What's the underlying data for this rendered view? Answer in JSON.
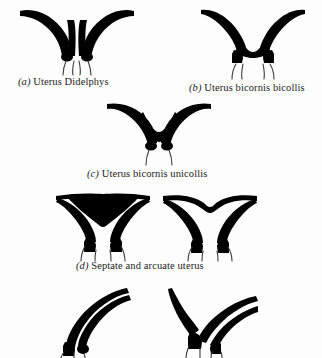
{
  "figure": {
    "background_color": "#fdfdfd",
    "ink_color": "#000000",
    "canal_line_color": "#3a3a3a",
    "panels": [
      {
        "id": "a",
        "label": "(a)",
        "name": "Uterus Didelphys",
        "caption": "(a) Uterus Didelphys",
        "description": "Two entirely separate uterine horns, each with its own cervical canal; three trailing canal lines",
        "horns": 2,
        "cervical_canals": 2
      },
      {
        "id": "b",
        "label": "(b)",
        "name": "Uterus bicornis bicollis",
        "caption": "(b) Uterus bicornis bicollis",
        "description": "Two horns fused at a deep V fundus with two separate cervices",
        "horns": 2,
        "cervical_canals": 2
      },
      {
        "id": "c",
        "label": "(c)",
        "name": "Uterus bicornis unicollis",
        "caption": "(c) Uterus bicornis unicollis",
        "description": "Two horns joining into a single cervix; deep V shaped fundal cleft",
        "horns": 2,
        "cervical_canals": 1
      },
      {
        "id": "d",
        "label": "(d)",
        "name": "Septate and arcuate uterus",
        "caption": "(d) Septate and arcuate uterus",
        "description": "Left drawing: septate uterus with broad flat fundus and thick midline septum. Right drawing: arcuate uterus with a shallow fundal indentation",
        "horns": 2,
        "cervical_canals": 1,
        "sub_figures": [
          {
            "id": "d-left",
            "name": "Septate uterus"
          },
          {
            "id": "d-right",
            "name": "Arcuate uterus"
          }
        ]
      },
      {
        "id": "e",
        "label": "",
        "name": "Unicornuate uterus variants",
        "caption": "",
        "description": "Bottom row, cropped at the page edge: two asymmetric single-horn (unicornuate) uterus drawings, the right one with a rudimentary horn",
        "sub_figures": [
          {
            "id": "e-left",
            "name": "Unicornuate uterus"
          },
          {
            "id": "e-right",
            "name": "Unicornuate uterus with rudimentary horn"
          }
        ]
      }
    ]
  }
}
